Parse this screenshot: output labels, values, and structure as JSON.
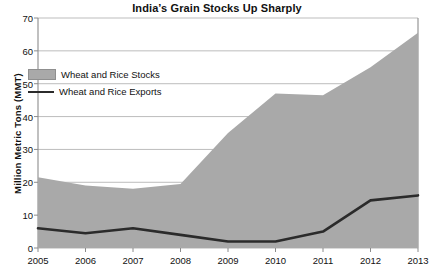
{
  "chart_data": {
    "type": "area",
    "title": "India’s Grain Stocks Up Sharply",
    "xlabel": "",
    "ylabel": "Million Metric Tons (MMT)",
    "categories": [
      "2005",
      "2006",
      "2007",
      "2008",
      "2009",
      "2010",
      "2011",
      "2012",
      "2013"
    ],
    "x": [
      2005,
      2006,
      2007,
      2008,
      2009,
      2010,
      2011,
      2012,
      2013
    ],
    "xlim": [
      2005,
      2013
    ],
    "ylim": [
      0,
      70
    ],
    "yticks": [
      0,
      10,
      20,
      30,
      40,
      50,
      60,
      70
    ],
    "ytick_labels": [
      "0",
      "10",
      "20",
      "30",
      "40",
      "50",
      "60",
      "70"
    ],
    "grid": "horizontal",
    "legend_position": "inside-upper-left",
    "series": [
      {
        "name": "Wheat and Rice Stocks",
        "type": "area",
        "color": "#a9a9a9",
        "values": [
          21.5,
          19.0,
          18.0,
          19.5,
          35.0,
          47.0,
          46.5,
          55.0,
          65.5
        ]
      },
      {
        "name": "Wheat and Rice Exports",
        "type": "line",
        "color": "#2b2b2b",
        "values": [
          6.0,
          4.5,
          6.0,
          4.0,
          2.0,
          2.0,
          5.0,
          14.5,
          16.0
        ]
      }
    ]
  },
  "legend": {
    "items": [
      {
        "label": "Wheat and Rice Stocks"
      },
      {
        "label": "Wheat and Rice Exports"
      }
    ]
  },
  "colors": {
    "area_fill": "#a9a9a9",
    "line": "#2b2b2b",
    "grid": "#b5b5b5",
    "axis": "#8c8c8c",
    "background": "#ffffff"
  }
}
